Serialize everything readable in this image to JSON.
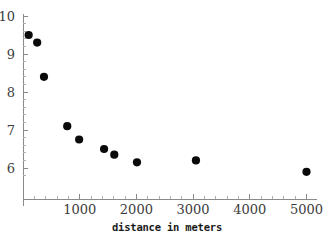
{
  "chart_data": {
    "type": "scatter",
    "title": "",
    "xlabel": "distance in meters",
    "ylabel": "",
    "xlim": [
      0,
      5200
    ],
    "ylim": [
      5.6,
      10.1
    ],
    "grid": false,
    "legend": null,
    "marker_color": "#0a0a0a",
    "axis_color": "#8a8a8a",
    "x_ticks": [
      1000,
      2000,
      3000,
      4000,
      5000
    ],
    "x_tick_labels": [
      "1000",
      "2000",
      "3000",
      "4000",
      "5000"
    ],
    "y_ticks": [
      6,
      7,
      8,
      9,
      10
    ],
    "y_tick_labels": [
      "6",
      "7",
      "8",
      "9",
      "10"
    ],
    "x_minor_tick_step": 200,
    "y_minor_tick_step": 0.2,
    "points": [
      {
        "x": 100,
        "y": 9.5
      },
      {
        "x": 250,
        "y": 9.3
      },
      {
        "x": 370,
        "y": 8.4
      },
      {
        "x": 780,
        "y": 7.1
      },
      {
        "x": 990,
        "y": 6.75
      },
      {
        "x": 1430,
        "y": 6.5
      },
      {
        "x": 1610,
        "y": 6.35
      },
      {
        "x": 2010,
        "y": 6.15
      },
      {
        "x": 3050,
        "y": 6.2
      },
      {
        "x": 5000,
        "y": 5.9
      }
    ]
  }
}
